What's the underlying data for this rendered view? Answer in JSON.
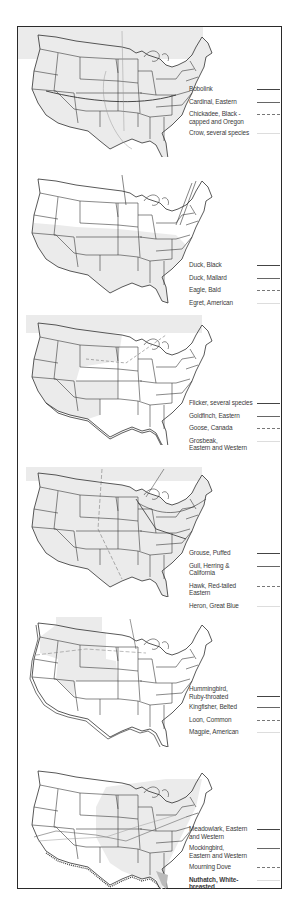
{
  "colors": {
    "frame": "#2a2a2a",
    "shade": "#ebebeb",
    "lines": "#3b3b3b",
    "text": "#3a3a3a"
  },
  "panels": [
    {
      "id": "panel-1",
      "shaded_region": "north",
      "legend": [
        {
          "label": "Bobolink",
          "style": "solid-heavy"
        },
        {
          "label": "Cardinal, Eastern",
          "style": "solid"
        },
        {
          "label": "Chickadee, Black -\n   capped  and Oregon",
          "style": "dashed"
        },
        {
          "label": "Crow, several  species",
          "style": "faint"
        }
      ]
    },
    {
      "id": "panel-2",
      "shaded_region": "south",
      "legend": [
        {
          "label": "Duck,  Black",
          "style": "solid-heavy"
        },
        {
          "label": "Duck, Mallard",
          "style": "solid"
        },
        {
          "label": "Eagle, Bald",
          "style": "dashed"
        },
        {
          "label": "Egret, American",
          "style": "faint"
        }
      ]
    },
    {
      "id": "panel-3",
      "shaded_region": "north-west",
      "legend": [
        {
          "label": "Flicker, several species",
          "style": "solid-heavy"
        },
        {
          "label": "Goldfinch, Eastern",
          "style": "solid"
        },
        {
          "label": "Goose, Canada",
          "style": "dashed"
        },
        {
          "label": "Grosbeak,\n  Eastern and Western",
          "style": "faint"
        }
      ]
    },
    {
      "id": "panel-4",
      "shaded_region": "all",
      "legend": [
        {
          "label": "Grouse, Puffed",
          "style": "solid-heavy"
        },
        {
          "label": "Gull, Herring & California",
          "style": "solid"
        },
        {
          "label": "Hawk, Red-tailed Eastern",
          "style": "dashed"
        },
        {
          "label": "Heron, Great Blue",
          "style": "faint"
        }
      ]
    },
    {
      "id": "panel-5",
      "shaded_region": "north-west-strip",
      "legend": [
        {
          "label": "Hummingbird,\n  Ruby-throated",
          "style": "solid-heavy"
        },
        {
          "label": "Kingfisher, Belted",
          "style": "solid"
        },
        {
          "label": "Loon, Common",
          "style": "dashed"
        },
        {
          "label": "Magpie, American",
          "style": "faint"
        }
      ]
    },
    {
      "id": "panel-6",
      "shaded_region": "central",
      "legend": [
        {
          "label": "Meadowlark, Eastern\n  and Western",
          "style": "solid-heavy"
        },
        {
          "label": "Mockingbird,\n  Eastern and Western",
          "style": "solid"
        },
        {
          "label": "Mourning Dove",
          "style": "dashed"
        },
        {
          "label": "Nuthatch, White-breasted",
          "style": "faint"
        }
      ]
    }
  ]
}
